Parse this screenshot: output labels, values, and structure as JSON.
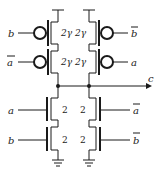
{
  "diagram": {
    "type": "CMOS transistor-level circuit",
    "output_label": "c",
    "pull_up": {
      "left": [
        {
          "input": "b",
          "input_bar": false,
          "size": "2γ"
        },
        {
          "input": "a",
          "input_bar": true,
          "size": "2γ"
        }
      ],
      "right": [
        {
          "input": "b",
          "input_bar": true,
          "size": "2γ"
        },
        {
          "input": "a",
          "input_bar": false,
          "size": "2γ"
        }
      ]
    },
    "pull_down": {
      "left": [
        {
          "input": "a",
          "input_bar": false,
          "size": "2"
        },
        {
          "input": "b",
          "input_bar": false,
          "size": "2"
        }
      ],
      "right": [
        {
          "input": "a",
          "input_bar": true,
          "size": "2"
        },
        {
          "input": "b",
          "input_bar": true,
          "size": "2"
        }
      ]
    }
  },
  "labels": {
    "p1_in": "b",
    "p1_size_l": "2γ",
    "p1_size_r": "2γ",
    "p1_in_r": "b",
    "p2_in": "a",
    "p2_size_l": "2γ",
    "p2_size_r": "2γ",
    "p2_in_r": "a",
    "n1_in": "a",
    "n1_size_l": "2",
    "n1_size_r": "2",
    "n1_in_r": "a",
    "n2_in": "b",
    "n2_size_l": "2",
    "n2_size_r": "2",
    "n2_in_r": "b",
    "out": "c"
  },
  "colors": {
    "stroke": "#1a1a1a",
    "background": "#ffffff"
  }
}
